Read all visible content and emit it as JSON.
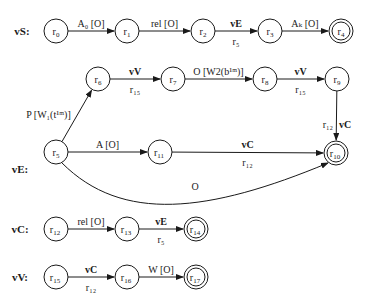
{
  "diagram": {
    "type": "finite-state-automata",
    "automata": [
      {
        "name": "vS:",
        "label_pos": [
          22,
          35
        ],
        "nodes": [
          {
            "id": "r0",
            "base": "r",
            "sub": "0",
            "x": 56,
            "y": 31,
            "final": false
          },
          {
            "id": "r1",
            "base": "r",
            "sub": "1",
            "x": 127,
            "y": 31,
            "final": false
          },
          {
            "id": "r2",
            "base": "r",
            "sub": "2",
            "x": 203,
            "y": 31,
            "final": false
          },
          {
            "id": "r3",
            "base": "r",
            "sub": "3",
            "x": 270,
            "y": 31,
            "final": false
          },
          {
            "id": "r4",
            "base": "r",
            "sub": "4",
            "x": 341,
            "y": 31,
            "final": true
          }
        ],
        "edges": [
          {
            "from": "r0",
            "to": "r1",
            "label": "A₀ [O]",
            "bold": false,
            "below": ""
          },
          {
            "from": "r1",
            "to": "r2",
            "label": "rel [O]",
            "bold": false,
            "below": ""
          },
          {
            "from": "r2",
            "to": "r3",
            "label": "vE",
            "bold": true,
            "below": "r₅"
          },
          {
            "from": "r3",
            "to": "r4",
            "label": "Aₖ [O]",
            "bold": false,
            "below": ""
          }
        ]
      },
      {
        "name": "vE:",
        "label_pos": [
          20,
          173
        ],
        "nodes": [
          {
            "id": "r5",
            "base": "r",
            "sub": "5",
            "x": 56,
            "y": 152,
            "final": false
          },
          {
            "id": "r6",
            "base": "r",
            "sub": "6",
            "x": 98,
            "y": 79,
            "final": false
          },
          {
            "id": "r7",
            "base": "r",
            "sub": "7",
            "x": 173,
            "y": 79,
            "final": false
          },
          {
            "id": "r8",
            "base": "r",
            "sub": "8",
            "x": 265,
            "y": 79,
            "final": false
          },
          {
            "id": "r9",
            "base": "r",
            "sub": "9",
            "x": 337,
            "y": 79,
            "final": false
          },
          {
            "id": "r10",
            "base": "r",
            "sub": "10",
            "x": 336,
            "y": 153,
            "final": true
          },
          {
            "id": "r11",
            "base": "r",
            "sub": "11",
            "x": 160,
            "y": 152,
            "final": false
          }
        ],
        "edges": [
          {
            "from": "r5",
            "to": "r6",
            "label": "P [W₁(t¹ᵐ)]",
            "bold": false,
            "below": ""
          },
          {
            "from": "r6",
            "to": "r7",
            "label": "vV",
            "bold": true,
            "below": "r₁₅"
          },
          {
            "from": "r7",
            "to": "r8",
            "label": "O [W2(b¹ᵐ)]",
            "bold": false,
            "below": ""
          },
          {
            "from": "r8",
            "to": "r9",
            "label": "vV",
            "bold": true,
            "below": "r₁₅"
          },
          {
            "from": "r9",
            "to": "r10",
            "label": "vC",
            "bold": true,
            "below": "r₁₂"
          },
          {
            "from": "r5",
            "to": "r11",
            "label": "A [O]",
            "bold": false,
            "below": ""
          },
          {
            "from": "r11",
            "to": "r10",
            "label": "vC",
            "bold": true,
            "below": "r₁₂"
          },
          {
            "from": "r5",
            "to": "r10",
            "label": "O",
            "bold": false,
            "below": "",
            "curved": true
          }
        ]
      },
      {
        "name": "vC:",
        "label_pos": [
          20,
          233
        ],
        "nodes": [
          {
            "id": "r12",
            "base": "r",
            "sub": "12",
            "x": 56,
            "y": 229,
            "final": false
          },
          {
            "id": "r13",
            "base": "r",
            "sub": "13",
            "x": 127,
            "y": 229,
            "final": false
          },
          {
            "id": "r14",
            "base": "r",
            "sub": "14",
            "x": 196,
            "y": 229,
            "final": true
          }
        ],
        "edges": [
          {
            "from": "r12",
            "to": "r13",
            "label": "rel [O]",
            "bold": false,
            "below": ""
          },
          {
            "from": "r13",
            "to": "r14",
            "label": "vE",
            "bold": true,
            "below": "r₅"
          }
        ]
      },
      {
        "name": "vV:",
        "label_pos": [
          20,
          281
        ],
        "nodes": [
          {
            "id": "r15",
            "base": "r",
            "sub": "15",
            "x": 56,
            "y": 277,
            "final": false
          },
          {
            "id": "r16",
            "base": "r",
            "sub": "16",
            "x": 127,
            "y": 277,
            "final": false
          },
          {
            "id": "r17",
            "base": "r",
            "sub": "17",
            "x": 196,
            "y": 277,
            "final": true
          }
        ],
        "edges": [
          {
            "from": "r15",
            "to": "r16",
            "label": "vC",
            "bold": true,
            "below": "r₁₂"
          },
          {
            "from": "r16",
            "to": "r17",
            "label": "W [O]",
            "bold": false,
            "below": ""
          }
        ]
      }
    ]
  }
}
